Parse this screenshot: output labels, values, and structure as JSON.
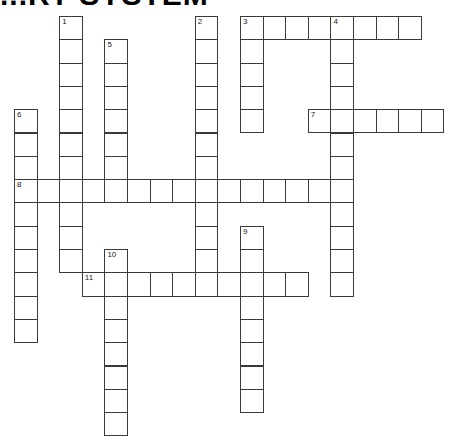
{
  "title": "...RY SYSTEM",
  "grid": {
    "origin_x": 14,
    "origin_y": 16,
    "cell_w": 22.6,
    "cell_h": 23.3
  },
  "clues": [
    {
      "number": "1",
      "direction": "down",
      "row": 0,
      "col": 2,
      "length": 11
    },
    {
      "number": "2",
      "direction": "down",
      "row": 0,
      "col": 8,
      "length": 12
    },
    {
      "number": "3",
      "direction": "across",
      "row": 0,
      "col": 10,
      "length": 8
    },
    {
      "number": "3",
      "direction": "down",
      "row": 0,
      "col": 10,
      "length": 5
    },
    {
      "number": "4",
      "direction": "down",
      "row": 0,
      "col": 14,
      "length": 12
    },
    {
      "number": "5",
      "direction": "down",
      "row": 1,
      "col": 4,
      "length": 7
    },
    {
      "number": "6",
      "direction": "down",
      "row": 4,
      "col": 0,
      "length": 10
    },
    {
      "number": "7",
      "direction": "across",
      "row": 4,
      "col": 13,
      "length": 6
    },
    {
      "number": "8",
      "direction": "across",
      "row": 7,
      "col": 0,
      "length": 15
    },
    {
      "number": "9",
      "direction": "down",
      "row": 9,
      "col": 10,
      "length": 8
    },
    {
      "number": "10",
      "direction": "down",
      "row": 10,
      "col": 4,
      "length": 8
    },
    {
      "number": "11",
      "direction": "across",
      "row": 11,
      "col": 3,
      "length": 10
    }
  ]
}
